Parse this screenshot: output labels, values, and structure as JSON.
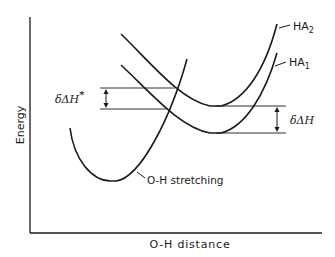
{
  "diagram": {
    "type": "potential-energy-curves",
    "axes": {
      "x_label": "O-H distance",
      "y_label": "Energy"
    },
    "curves": [
      {
        "id": "HA2",
        "label_main": "HA",
        "label_sub": "2",
        "description": "upper acid dissociation curve"
      },
      {
        "id": "HA1",
        "label_main": "HA",
        "label_sub": "1",
        "description": "lower acid dissociation curve"
      },
      {
        "id": "oh-stretching",
        "label": "O-H stretching"
      }
    ],
    "annotations": {
      "delta_dh_star": {
        "label": "δΔH",
        "superscript": "*"
      },
      "delta_dh": {
        "label": "δΔH"
      }
    },
    "colors": {
      "line": "#1a1a1a",
      "background": "#ffffff"
    }
  }
}
